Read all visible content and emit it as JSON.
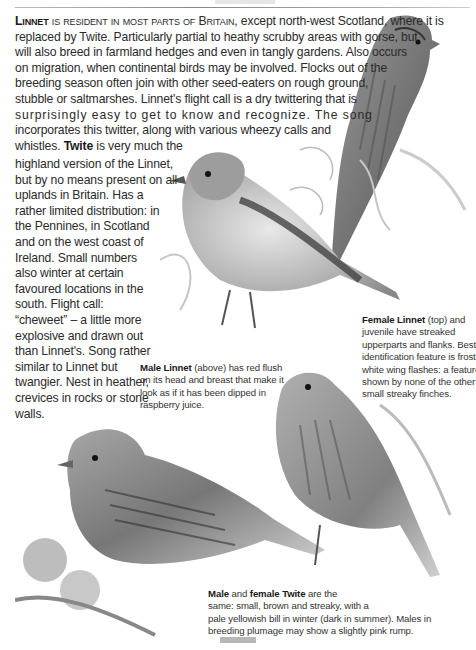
{
  "page": {
    "header_rule": true
  },
  "intro": {
    "lead_bold": "Linnet",
    "lead_smallcaps": " is resident in most parts of Britain",
    "lines": [
      ", except north-west Scotland, where it is",
      "replaced by Twite. Particularly partial to heathy scrubby areas with gorse, but",
      "will also breed in farmland hedges and even in tangly gardens. Also occurs",
      "on migration, when continental birds may be involved. Flocks out of the",
      "breeding season often join with other seed-eaters on rough ground,",
      "stubble or saltmarshes. Linnet's flight call is a dry twittering that is",
      "surprisingly easy to get to know and recognize. The song",
      "incorporates this twitter, along with various wheezy calls and"
    ],
    "twite_pre": "whistles. ",
    "twite_bold": "Twite",
    "twite_post": " is very much the"
  },
  "twite_column": {
    "lines": [
      "highland version of the Linnet,",
      "but by no means present on all",
      "uplands in Britain. Has a",
      "rather limited distribution: in",
      "the Pennines, in Scotland",
      "and on the west coast of",
      "Ireland. Small numbers",
      "also winter at certain",
      "favoured locations in the",
      "south. Flight call:",
      "“cheweet” – a little more",
      "explosive and drawn out",
      "than Linnet's. Song rather",
      "similar to Linnet but",
      "twangier. Nest in heather,",
      "crevices in rocks or stone",
      "walls."
    ]
  },
  "captions": {
    "female_linnet": {
      "bold": "Female Linnet",
      "first_rest": "  (top) and",
      "lines": [
        "juvenile have streaked",
        "upperparts and flanks. Best",
        "identification feature is frosty",
        "white wing flashes: a feature",
        "shown by none of the other",
        "small streaky finches."
      ]
    },
    "male_linnet": {
      "bold": "Male Linnet",
      "first_rest": " (above) has red flush",
      "lines": [
        "on its head and breast that make it",
        "look as if it has been dipped in",
        "raspberry juice."
      ]
    },
    "twite": {
      "bold1": "Male",
      "mid": " and ",
      "bold2": "female Twite",
      "first_rest": " are the",
      "lines": [
        "same: small, brown and streaky, with a",
        "pale yellowish bill in winter (dark in summer). Males in",
        "breeding plumage may show a slightly pink rump."
      ]
    }
  },
  "illustrations": [
    {
      "name": "female-linnet",
      "label": "Female Linnet perched on gorse (top right)"
    },
    {
      "name": "male-linnet",
      "label": "Male Linnet perched among ferns (centre)"
    },
    {
      "name": "twite-left",
      "label": "Twite perched on thistle (bottom left)"
    },
    {
      "name": "twite-right",
      "label": "Twite perched on heather (bottom right)"
    }
  ],
  "colors": {
    "text": "#2b2b2b",
    "rule": "#999999",
    "page_tab": "#b8b8b8"
  }
}
